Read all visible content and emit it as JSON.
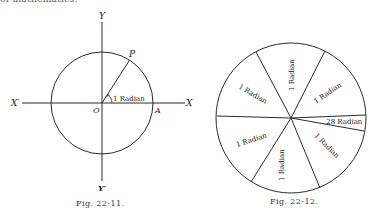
{
  "page": {
    "clipped_top_text": "of mathematics."
  },
  "figures": [
    {
      "id": "fig-22-11",
      "caption": "Fig. 22-11.",
      "labels": {
        "y_axis": "Y",
        "y_axis_neg": "Y′",
        "x_axis": "X",
        "x_axis_neg": "X′",
        "origin": "O",
        "point_a": "A",
        "point_p": "P",
        "angle": "1 Radian"
      }
    },
    {
      "id": "fig-22-12",
      "caption": "Fig. 22-12.",
      "sectors": [
        {
          "label": "1 Radian"
        },
        {
          "label": "1 Radian"
        },
        {
          "label": "1 Radian"
        },
        {
          "label": "1 Radian"
        },
        {
          "label": "1 Radian"
        },
        {
          "label": "1 Radian"
        },
        {
          "label": ".28 Radian"
        }
      ]
    }
  ]
}
